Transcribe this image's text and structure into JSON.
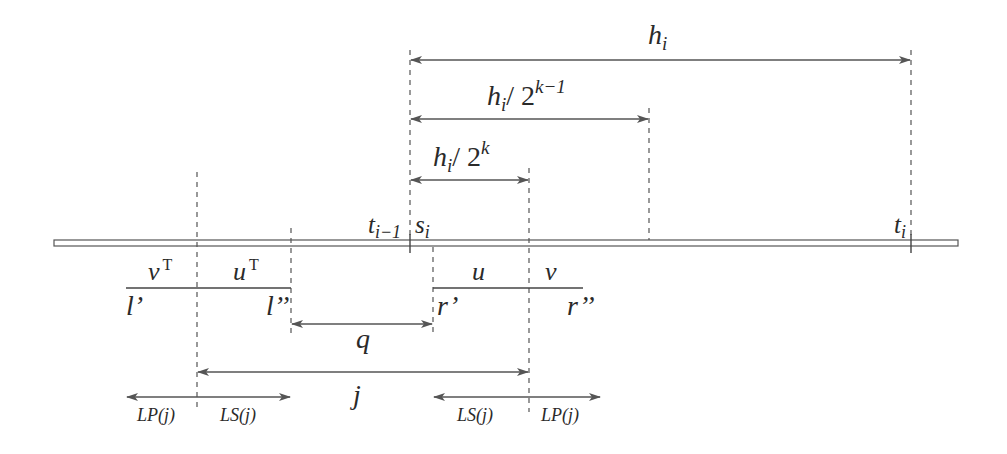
{
  "diagram": {
    "type": "interval-timeline",
    "timeline_bar": {
      "x_start": 54,
      "x_end": 958,
      "y": 243
    },
    "markers": {
      "t_prev": {
        "label": "t",
        "sub": "i−1",
        "x": 410
      },
      "s_i": {
        "label": "s",
        "sub": "i",
        "x": 433
      },
      "t_i": {
        "label": "t",
        "sub": "i",
        "x": 911
      }
    },
    "spans": {
      "h_i": {
        "label": "h",
        "sub": "i",
        "from": 410,
        "to": 911,
        "y": 60
      },
      "h_half_k1": {
        "label": "h",
        "sub": "i",
        "slash": "/ 2",
        "sup": "k−1",
        "from": 410,
        "to": 649,
        "y": 119
      },
      "h_half_k": {
        "label": "h",
        "sub": "i",
        "slash": "/ 2",
        "sup": "k",
        "from": 410,
        "to": 529,
        "y": 180
      },
      "q": {
        "label": "q",
        "from": 291,
        "to": 433,
        "y": 324
      },
      "j": {
        "label": "j",
        "from": 197,
        "to": 529,
        "y": 372
      }
    },
    "left_segment": {
      "left_label": "v",
      "left_sup": "T",
      "right_label": "u",
      "right_sup": "T",
      "start_label": "l’",
      "end_label": "l’’",
      "from": 126,
      "mid": 197,
      "to": 291,
      "y": 288
    },
    "right_segment": {
      "left_label": "u",
      "right_label": "v",
      "start_label": "r’",
      "end_label": "r’’",
      "from": 433,
      "mid": 529,
      "to": 583,
      "y": 288
    },
    "bottom_arrows": {
      "left": {
        "lp_label": "LP(j)",
        "ls_label": "LS(j)",
        "from": 126,
        "to": 291,
        "y": 397
      },
      "right": {
        "ls_label": "LS(j)",
        "lp_label": "LP(j)",
        "from": 433,
        "to": 600,
        "y": 397
      }
    }
  }
}
